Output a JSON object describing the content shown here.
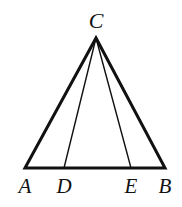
{
  "figure": {
    "kind": "geometry-diagram",
    "background_color": "#ffffff",
    "stroke_color": "#111111",
    "canvas": {
      "width": 182,
      "height": 207
    },
    "points": {
      "A": {
        "label": "A",
        "x": 25,
        "y": 168
      },
      "D": {
        "label": "D",
        "x": 64,
        "y": 168
      },
      "E": {
        "label": "E",
        "x": 131,
        "y": 168
      },
      "B": {
        "label": "B",
        "x": 165,
        "y": 168
      },
      "C": {
        "label": "C",
        "x": 96,
        "y": 38
      }
    },
    "segments": [
      {
        "name": "side-AC",
        "from": "A",
        "to": "C",
        "stroke_width": 3,
        "kind": "triangle-side"
      },
      {
        "name": "side-CB",
        "from": "C",
        "to": "B",
        "stroke_width": 3,
        "kind": "triangle-side"
      },
      {
        "name": "base-AB",
        "from": "A",
        "to": "B",
        "stroke_width": 3,
        "kind": "triangle-side"
      },
      {
        "name": "cevian-CD",
        "from": "C",
        "to": "D",
        "stroke_width": 1.4,
        "kind": "cevian"
      },
      {
        "name": "cevian-CE",
        "from": "C",
        "to": "E",
        "stroke_width": 1.4,
        "kind": "cevian"
      }
    ],
    "labels": {
      "apex": "C",
      "base_left": "A",
      "base_d": "D",
      "base_e": "E",
      "base_right": "B"
    },
    "apex_label_position": {
      "x": 96,
      "y": 20
    }
  }
}
